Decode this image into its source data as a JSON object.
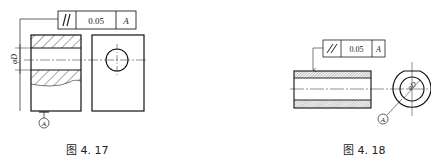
{
  "figures": [
    {
      "id": "fig-4-17",
      "caption": "图 4. 17",
      "fcf": {
        "symbol": "//",
        "symbol_name": "parallelism",
        "tolerance": "0.05",
        "datum": "A"
      },
      "dimension_label": "φD",
      "datum_label": "A",
      "views": [
        "section-view-with-hole",
        "end-view-with-circle"
      ]
    },
    {
      "id": "fig-4-18",
      "caption": "图 4. 18",
      "fcf": {
        "symbol": "//",
        "symbol_name": "parallelism",
        "tolerance": "0.05",
        "datum": "A"
      },
      "dimension_label": "φD",
      "datum_label": "A",
      "views": [
        "tube-section-view",
        "end-view-ring"
      ]
    }
  ],
  "colors": {
    "line": "#1a1a1a",
    "background": "#ffffff"
  }
}
